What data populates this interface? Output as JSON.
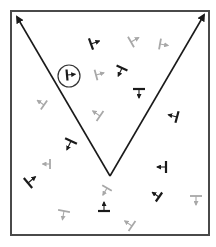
{
  "diagram": {
    "type": "vector-field-glyph-diagram",
    "frame": {
      "x": 11,
      "y": 11,
      "width": 198,
      "height": 224,
      "stroke": "#4a4a4a",
      "stroke_width": 2
    },
    "v_arrows": {
      "apex": {
        "x": 110,
        "y": 176
      },
      "left_tip": {
        "x": 17,
        "y": 17
      },
      "right_tip": {
        "x": 204,
        "y": 15
      },
      "color": "#1a1a1a",
      "stroke_width": 1.6
    },
    "colors": {
      "dark": "#1a1a1a",
      "light": "#a8a8a8",
      "circle": "#333333"
    },
    "highlight_circle": {
      "cx": 69,
      "cy": 76,
      "r": 11
    },
    "glyphs": [
      {
        "id": "g1",
        "x": 91,
        "y": 44,
        "angle": -20,
        "color": "dark",
        "len": 12
      },
      {
        "id": "g2",
        "x": 67,
        "y": 75,
        "angle": -5,
        "color": "dark",
        "len": 11
      },
      {
        "id": "g3",
        "x": 96,
        "y": 75,
        "angle": -15,
        "color": "light",
        "len": 11
      },
      {
        "id": "g4",
        "x": 131,
        "y": 42,
        "angle": -30,
        "color": "light",
        "len": 12
      },
      {
        "id": "g5",
        "x": 160,
        "y": 44,
        "angle": 10,
        "color": "light",
        "len": 11
      },
      {
        "id": "g6",
        "x": 122,
        "y": 68,
        "angle": 115,
        "color": "dark",
        "len": 12
      },
      {
        "id": "g7",
        "x": 139,
        "y": 89,
        "angle": 90,
        "color": "dark",
        "len": 12
      },
      {
        "id": "g8",
        "x": 177,
        "y": 117,
        "angle": 195,
        "color": "dark",
        "len": 12
      },
      {
        "id": "g9",
        "x": 44,
        "y": 105,
        "angle": 215,
        "color": "light",
        "len": 11
      },
      {
        "id": "g10",
        "x": 100,
        "y": 116,
        "angle": 215,
        "color": "light",
        "len": 12
      },
      {
        "id": "g11",
        "x": 71,
        "y": 141,
        "angle": 115,
        "color": "dark",
        "len": 13
      },
      {
        "id": "g12",
        "x": 50,
        "y": 164,
        "angle": 180,
        "color": "light",
        "len": 10
      },
      {
        "id": "g13",
        "x": 28,
        "y": 183,
        "angle": -40,
        "color": "dark",
        "len": 13
      },
      {
        "id": "g14",
        "x": 107,
        "y": 188,
        "angle": 120,
        "color": "light",
        "len": 11
      },
      {
        "id": "g15",
        "x": 104,
        "y": 211,
        "angle": -90,
        "color": "dark",
        "len": 12
      },
      {
        "id": "g16",
        "x": 64,
        "y": 211,
        "angle": 100,
        "color": "light",
        "len": 12
      },
      {
        "id": "g17",
        "x": 166,
        "y": 167,
        "angle": 180,
        "color": "dark",
        "len": 12
      },
      {
        "id": "g18",
        "x": 159,
        "y": 197,
        "angle": 215,
        "color": "dark",
        "len": 11
      },
      {
        "id": "g19",
        "x": 196,
        "y": 196,
        "angle": 90,
        "color": "light",
        "len": 12
      },
      {
        "id": "g20",
        "x": 132,
        "y": 226,
        "angle": 215,
        "color": "light",
        "len": 12
      }
    ]
  }
}
